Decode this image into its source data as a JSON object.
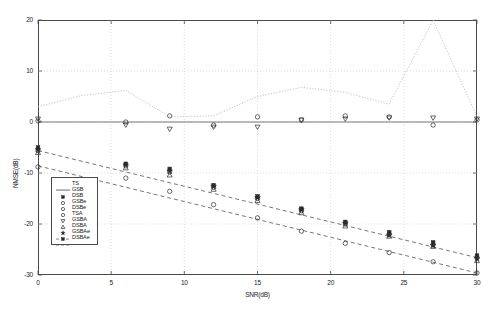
{
  "figure": {
    "background": "#ffffff",
    "axis_color": "#4a4a4a",
    "grid_color": "#c8c8c8",
    "series_color": "#2b2b2b"
  },
  "axes": {
    "xlabel": "SNR(dB)",
    "ylabel": "NMSE(dB)",
    "xlim": [
      0,
      30
    ],
    "ylim": [
      -30,
      20
    ],
    "xticks": [
      0,
      5,
      10,
      15,
      20,
      25,
      30
    ],
    "yticks": [
      20,
      10,
      0,
      -10,
      -20,
      -30
    ],
    "xticklabels": [
      "0",
      "5",
      "10",
      "15",
      "20",
      "25",
      "30"
    ],
    "yticklabels": [
      "20",
      "10",
      "0",
      "-10",
      "-20",
      "-30"
    ],
    "grid": true,
    "grid_style": "dotted"
  },
  "legend": {
    "position": "lower-left-inside",
    "entries": [
      {
        "label": "TS",
        "marker": "none",
        "line": "solid-short"
      },
      {
        "label": "GSB",
        "marker": "filled-square",
        "line": "none"
      },
      {
        "label": "DSB",
        "marker": "open-circle",
        "line": "none"
      },
      {
        "label": "GSBe",
        "marker": "open-circle",
        "line": "none"
      },
      {
        "label": "DSBe",
        "marker": "open-circle",
        "line": "none"
      },
      {
        "label": "TSA",
        "marker": "down-triangle",
        "line": "none"
      },
      {
        "label": "GSBA",
        "marker": "up-triangle",
        "line": "none"
      },
      {
        "label": "DSBA",
        "marker": "star",
        "line": "none"
      },
      {
        "label": "GSBAe",
        "marker": "filled-square",
        "line": "dashed"
      },
      {
        "label": "DSBAe",
        "marker": "none",
        "line": "dashed"
      }
    ]
  },
  "chart_data": {
    "type": "scatter",
    "title": "",
    "xlabel": "SNR(dB)",
    "ylabel": "NMSE(dB)",
    "xlim": [
      0,
      30
    ],
    "ylim": [
      -30,
      20
    ],
    "grid": true,
    "legend_position": "lower-left",
    "x": [
      0,
      3,
      6,
      9,
      12,
      15,
      18,
      21,
      24,
      27,
      30
    ],
    "series": [
      {
        "name": "TS",
        "marker": "none",
        "linestyle": "dotted",
        "values": [
          3.0,
          5.2,
          6.2,
          1.0,
          1.2,
          5.0,
          6.8,
          5.8,
          3.5,
          20.0,
          1.0
        ]
      },
      {
        "name": "GSB",
        "marker": "filled-square",
        "linestyle": "none",
        "values": [
          -5.0,
          null,
          -8.2,
          -9.2,
          -12.4,
          -14.6,
          -17.0,
          -19.6,
          -21.6,
          -23.6,
          -26.2
        ]
      },
      {
        "name": "DSB",
        "marker": "open-circle",
        "linestyle": "none",
        "values": [
          -8.8,
          null,
          -11.0,
          -13.6,
          -16.2,
          -18.8,
          -21.4,
          -23.8,
          -25.6,
          -27.4,
          -29.6
        ]
      },
      {
        "name": "GSBe",
        "marker": "open-circle",
        "linestyle": "none",
        "values": [
          -5.6,
          null,
          -8.6,
          -9.8,
          -12.8,
          -15.0,
          -17.4,
          -20.0,
          -22.0,
          -24.0,
          -26.6
        ]
      },
      {
        "name": "DSBe",
        "marker": "open-circle",
        "linestyle": "none",
        "values": [
          0.2,
          null,
          0.0,
          1.2,
          -0.6,
          1.0,
          0.4,
          1.2,
          1.0,
          -0.6,
          0.4
        ]
      },
      {
        "name": "TSA",
        "marker": "down-triangle",
        "linestyle": "none",
        "values": [
          0.6,
          null,
          -0.6,
          -1.4,
          -1.0,
          -1.0,
          0.4,
          0.6,
          0.8,
          0.8,
          0.6
        ]
      },
      {
        "name": "GSBA",
        "marker": "up-triangle",
        "linestyle": "none",
        "values": [
          -6.0,
          null,
          -9.0,
          -10.4,
          -13.2,
          -15.4,
          -17.8,
          -20.4,
          -22.4,
          -24.4,
          -27.2
        ]
      },
      {
        "name": "DSBA",
        "marker": "star",
        "linestyle": "none",
        "values": [
          -5.4,
          null,
          -8.4,
          -9.6,
          -12.6,
          -14.8,
          -17.2,
          -19.8,
          -22.2,
          -24.2,
          -26.8
        ]
      },
      {
        "name": "GSBAe",
        "marker": "none",
        "linestyle": "dashed",
        "fit": {
          "intercept": -5.6,
          "slope": -0.7
        }
      },
      {
        "name": "DSBAe",
        "marker": "none",
        "linestyle": "dashed",
        "fit": {
          "intercept": -8.6,
          "slope": -0.7
        }
      }
    ]
  }
}
